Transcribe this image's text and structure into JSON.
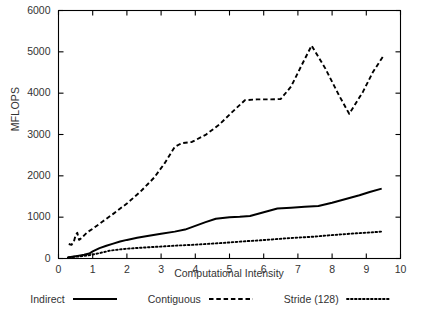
{
  "chart_data": {
    "type": "line",
    "title": "",
    "xlabel": "Computational Intensity",
    "ylabel": "MFLOPS",
    "xlim": [
      0,
      10
    ],
    "ylim": [
      0,
      6000
    ],
    "xticks": [
      "0",
      "1",
      "2",
      "3",
      "4",
      "5",
      "6",
      "7",
      "8",
      "9",
      "10"
    ],
    "yticks": [
      "0",
      "1000",
      "2000",
      "3000",
      "4000",
      "5000",
      "6000"
    ],
    "grid": false,
    "legend_position": "below-axes",
    "series": [
      {
        "name": "Indirect",
        "style": "solid",
        "color": "#000000",
        "points": [
          [
            0.25,
            20
          ],
          [
            0.4,
            40
          ],
          [
            0.5,
            55
          ],
          [
            0.6,
            70
          ],
          [
            0.75,
            90
          ],
          [
            0.9,
            120
          ],
          [
            1.0,
            170
          ],
          [
            1.2,
            250
          ],
          [
            1.4,
            310
          ],
          [
            1.6,
            360
          ],
          [
            1.8,
            410
          ],
          [
            2.0,
            450
          ],
          [
            2.3,
            500
          ],
          [
            2.6,
            545
          ],
          [
            3.0,
            600
          ],
          [
            3.4,
            650
          ],
          [
            3.7,
            700
          ],
          [
            4.0,
            790
          ],
          [
            4.3,
            880
          ],
          [
            4.6,
            960
          ],
          [
            5.0,
            1000
          ],
          [
            5.3,
            1010
          ],
          [
            5.6,
            1030
          ],
          [
            6.0,
            1120
          ],
          [
            6.4,
            1210
          ],
          [
            6.8,
            1230
          ],
          [
            7.2,
            1250
          ],
          [
            7.6,
            1270
          ],
          [
            8.0,
            1350
          ],
          [
            8.4,
            1440
          ],
          [
            8.8,
            1530
          ],
          [
            9.1,
            1610
          ],
          [
            9.45,
            1690
          ]
        ]
      },
      {
        "name": "Contiguous",
        "style": "dashed",
        "color": "#000000",
        "points": [
          [
            0.3,
            350
          ],
          [
            0.38,
            330
          ],
          [
            0.45,
            410
          ],
          [
            0.5,
            560
          ],
          [
            0.55,
            620
          ],
          [
            0.6,
            450
          ],
          [
            0.67,
            490
          ],
          [
            0.75,
            560
          ],
          [
            0.85,
            640
          ],
          [
            1.0,
            720
          ],
          [
            1.3,
            900
          ],
          [
            1.6,
            1080
          ],
          [
            2.0,
            1330
          ],
          [
            2.4,
            1620
          ],
          [
            2.8,
            1960
          ],
          [
            3.1,
            2300
          ],
          [
            3.4,
            2700
          ],
          [
            3.6,
            2790
          ],
          [
            3.9,
            2820
          ],
          [
            4.3,
            2990
          ],
          [
            4.7,
            3240
          ],
          [
            5.1,
            3560
          ],
          [
            5.45,
            3830
          ],
          [
            5.8,
            3850
          ],
          [
            6.2,
            3850
          ],
          [
            6.5,
            3860
          ],
          [
            6.8,
            4160
          ],
          [
            7.1,
            4660
          ],
          [
            7.4,
            5150
          ],
          [
            7.8,
            4600
          ],
          [
            8.2,
            3950
          ],
          [
            8.5,
            3500
          ],
          [
            8.9,
            4030
          ],
          [
            9.2,
            4520
          ],
          [
            9.5,
            4900
          ]
        ]
      },
      {
        "name": "Stride (128)",
        "style": "dotted",
        "color": "#000000",
        "points": [
          [
            0.3,
            30
          ],
          [
            0.6,
            50
          ],
          [
            0.9,
            80
          ],
          [
            1.2,
            130
          ],
          [
            1.5,
            190
          ],
          [
            1.9,
            230
          ],
          [
            2.3,
            255
          ],
          [
            2.7,
            275
          ],
          [
            3.1,
            295
          ],
          [
            3.5,
            315
          ],
          [
            3.9,
            330
          ],
          [
            4.3,
            350
          ],
          [
            4.7,
            370
          ],
          [
            5.1,
            395
          ],
          [
            5.5,
            420
          ],
          [
            5.9,
            440
          ],
          [
            6.3,
            465
          ],
          [
            6.7,
            490
          ],
          [
            7.1,
            510
          ],
          [
            7.5,
            530
          ],
          [
            7.9,
            560
          ],
          [
            8.3,
            585
          ],
          [
            8.7,
            610
          ],
          [
            9.1,
            630
          ],
          [
            9.45,
            650
          ]
        ]
      }
    ]
  },
  "legend": {
    "entries": [
      {
        "label": "Indirect",
        "style": "solid"
      },
      {
        "label": "Contiguous",
        "style": "dashed"
      },
      {
        "label": "Stride (128)",
        "style": "dotted"
      }
    ]
  }
}
